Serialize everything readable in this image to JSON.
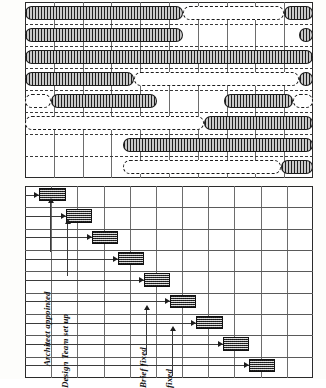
{
  "figure": {
    "ink_color": "#1c1c1c",
    "bar_fill": "#b4b4b4",
    "milestone_fill": "#8e8e8e",
    "paper": "#ffffff"
  },
  "top_chart": {
    "name": "gantt-bar-chart",
    "columns": 10,
    "rows": 8,
    "grid": {
      "vertical": true,
      "horizontal_dashed": true
    },
    "bars": [
      {
        "id": "activity-1",
        "start": 0.0,
        "end": 5.5,
        "type": "work",
        "row": 0
      },
      {
        "id": "activity-1-float",
        "start": 5.5,
        "end": 9.0,
        "type": "float",
        "row": 0
      },
      {
        "id": "activity-1b",
        "start": 9.0,
        "end": 10.0,
        "type": "work",
        "row": 0
      },
      {
        "id": "activity-2",
        "start": 0.0,
        "end": 5.5,
        "type": "work",
        "row": 1
      },
      {
        "id": "activity-2b",
        "start": 9.5,
        "end": 10.0,
        "type": "work",
        "row": 1
      },
      {
        "id": "activity-3",
        "start": 0.0,
        "end": 10.0,
        "type": "work",
        "row": 2
      },
      {
        "id": "activity-4",
        "start": 0.0,
        "end": 3.8,
        "type": "work",
        "row": 3
      },
      {
        "id": "activity-4-float",
        "start": 3.8,
        "end": 9.5,
        "type": "float",
        "row": 3
      },
      {
        "id": "activity-4b",
        "start": 9.5,
        "end": 10.0,
        "type": "work",
        "row": 3
      },
      {
        "id": "activity-5-float-a",
        "start": 0.0,
        "end": 0.9,
        "type": "float",
        "row": 4
      },
      {
        "id": "activity-5",
        "start": 0.9,
        "end": 4.6,
        "type": "work",
        "row": 4
      },
      {
        "id": "activity-5b",
        "start": 6.9,
        "end": 9.3,
        "type": "work",
        "row": 4
      },
      {
        "id": "activity-5-float-b",
        "start": 9.3,
        "end": 10.0,
        "type": "float",
        "row": 4
      },
      {
        "id": "activity-6-float",
        "start": 0.0,
        "end": 6.2,
        "type": "float",
        "row": 5
      },
      {
        "id": "activity-6",
        "start": 6.2,
        "end": 10.0,
        "type": "work",
        "row": 5
      },
      {
        "id": "activity-7",
        "start": 3.4,
        "end": 10.0,
        "type": "work",
        "row": 6
      },
      {
        "id": "activity-8-float",
        "start": 3.4,
        "end": 8.9,
        "type": "float",
        "row": 7
      },
      {
        "id": "activity-8",
        "start": 8.9,
        "end": 10.0,
        "type": "work",
        "row": 7
      }
    ]
  },
  "bottom_chart": {
    "name": "milestone-staircase-chart",
    "columns": 11,
    "rows": 9,
    "grid": {
      "vertical": true,
      "horizontal": true
    },
    "milestones": [
      {
        "id": "milestone-1",
        "col": 0.55,
        "row": 0,
        "width_cols": 1.0
      },
      {
        "id": "milestone-2",
        "col": 1.55,
        "row": 1,
        "width_cols": 1.0
      },
      {
        "id": "milestone-3",
        "col": 2.55,
        "row": 2,
        "width_cols": 1.0
      },
      {
        "id": "milestone-4",
        "col": 3.55,
        "row": 3,
        "width_cols": 1.0
      },
      {
        "id": "milestone-5",
        "col": 4.55,
        "row": 4,
        "width_cols": 1.0
      },
      {
        "id": "milestone-6",
        "col": 5.55,
        "row": 5,
        "width_cols": 1.0
      },
      {
        "id": "milestone-7",
        "col": 6.55,
        "row": 6,
        "width_cols": 1.0
      },
      {
        "id": "milestone-8",
        "col": 7.55,
        "row": 7,
        "width_cols": 1.0
      },
      {
        "id": "milestone-9",
        "col": 8.55,
        "row": 8,
        "width_cols": 1.0
      }
    ],
    "labels": [
      {
        "id": "label-architect-appointed",
        "text": "Architect appointed"
      },
      {
        "id": "label-design-team-set-up",
        "text": "Design Team set up"
      },
      {
        "id": "label-brief-fixed",
        "text": "Brief fixed"
      },
      {
        "id": "label-fixed",
        "text": "fixed"
      }
    ]
  }
}
